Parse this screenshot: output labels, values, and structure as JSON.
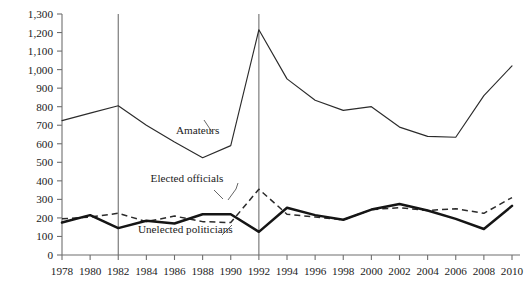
{
  "chart_data": {
    "type": "line",
    "title": "",
    "xlabel": "",
    "ylabel": "",
    "grid": false,
    "legend_position": "inline-annotations",
    "xlim": [
      1978,
      2010
    ],
    "ylim": [
      0,
      1300
    ],
    "ytick_step": 100,
    "x": [
      1978,
      1980,
      1982,
      1984,
      1986,
      1988,
      1990,
      1992,
      1994,
      1996,
      1998,
      2000,
      2002,
      2004,
      2006,
      2008,
      2010
    ],
    "xticklabels": [
      "1978",
      "1980",
      "1982",
      "1984",
      "1986",
      "1988",
      "1990",
      "1992",
      "1994",
      "1996",
      "1998",
      "2000",
      "2002",
      "2004",
      "2006",
      "2008",
      "2010"
    ],
    "yticklabels": [
      "0",
      "100",
      "200",
      "300",
      "400",
      "500",
      "600",
      "700",
      "800",
      "900",
      "1,000",
      "1,100",
      "1,200",
      "1,300"
    ],
    "yticks": [
      0,
      100,
      200,
      300,
      400,
      500,
      600,
      700,
      800,
      900,
      1000,
      1100,
      1200,
      1300
    ],
    "series": [
      {
        "name": "Amateurs",
        "style": "solid-thin",
        "color": "#2b2b2b",
        "values": [
          725,
          765,
          805,
          700,
          610,
          525,
          590,
          1215,
          950,
          835,
          780,
          800,
          690,
          640,
          635,
          860,
          1020
        ]
      },
      {
        "name": "Elected officials",
        "style": "dashed",
        "color": "#2b2b2b",
        "values": [
          195,
          205,
          225,
          180,
          210,
          180,
          175,
          355,
          220,
          205,
          190,
          245,
          255,
          240,
          250,
          225,
          310
        ]
      },
      {
        "name": "Unelected politicians",
        "style": "solid-bold",
        "color": "#151515",
        "values": [
          175,
          215,
          145,
          185,
          170,
          220,
          220,
          125,
          255,
          215,
          190,
          245,
          275,
          240,
          195,
          140,
          265
        ]
      }
    ],
    "vertical_markers": [
      1982,
      1992
    ],
    "annotations": [
      {
        "text": "Amateurs",
        "x": 1986.1,
        "y": 655
      },
      {
        "text": "Elected officials",
        "x": 1984.3,
        "y": 395
      },
      {
        "text": "Unelected politicians",
        "x": 1983.4,
        "y": 120
      }
    ]
  }
}
